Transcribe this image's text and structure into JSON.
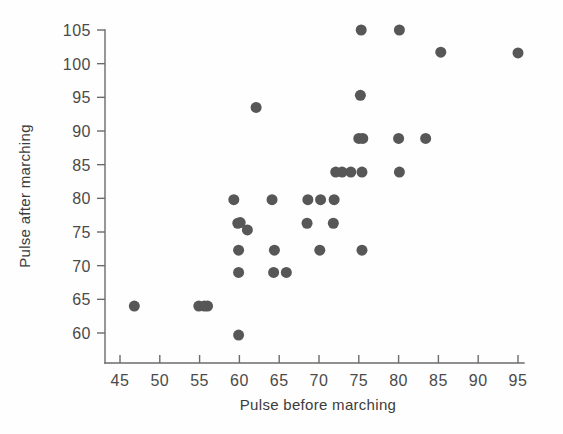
{
  "figure": {
    "name": "pulse-scatterplot",
    "background_color": "#fefefe",
    "point_color": "#575757",
    "axis_color": "#6b6b6b",
    "text_color": "#4a4a4a"
  },
  "chart_data": {
    "type": "scatter",
    "title": "",
    "xlabel": "Pulse before marching",
    "ylabel": "Pulse after marching",
    "xlim": [
      43,
      97
    ],
    "ylim": [
      57.5,
      106.5
    ],
    "xticks": [
      45,
      50,
      55,
      60,
      65,
      70,
      75,
      80,
      85,
      90,
      95
    ],
    "xticklabels": [
      "45",
      "50",
      "55",
      "60",
      "65",
      "70",
      "75",
      "80",
      "85",
      "90",
      "95"
    ],
    "yticks": [
      60,
      65,
      70,
      75,
      80,
      85,
      90,
      95,
      100,
      105
    ],
    "yticklabels": [
      "60",
      "65",
      "70",
      "75",
      "80",
      "85",
      "90",
      "95",
      "100",
      "105"
    ],
    "grid": false,
    "legend": false,
    "marker": "circle",
    "marker_size": 8,
    "n_points": 37,
    "points": [
      {
        "x": 46.8,
        "y": 64.0
      },
      {
        "x": 54.9,
        "y": 64.0
      },
      {
        "x": 56.0,
        "y": 64.0
      },
      {
        "x": 59.9,
        "y": 59.7
      },
      {
        "x": 59.9,
        "y": 69.0
      },
      {
        "x": 59.9,
        "y": 72.3
      },
      {
        "x": 59.8,
        "y": 76.3
      },
      {
        "x": 59.3,
        "y": 79.8
      },
      {
        "x": 61.0,
        "y": 75.3
      },
      {
        "x": 62.1,
        "y": 93.5
      },
      {
        "x": 64.3,
        "y": 69.0
      },
      {
        "x": 64.4,
        "y": 72.3
      },
      {
        "x": 64.1,
        "y": 79.8
      },
      {
        "x": 65.9,
        "y": 69.0
      },
      {
        "x": 68.5,
        "y": 76.3
      },
      {
        "x": 68.6,
        "y": 79.8
      },
      {
        "x": 70.1,
        "y": 72.3
      },
      {
        "x": 70.2,
        "y": 79.8
      },
      {
        "x": 71.8,
        "y": 76.3
      },
      {
        "x": 71.9,
        "y": 79.8
      },
      {
        "x": 72.1,
        "y": 83.9
      },
      {
        "x": 74.0,
        "y": 83.9
      },
      {
        "x": 75.0,
        "y": 88.9
      },
      {
        "x": 75.4,
        "y": 83.9
      },
      {
        "x": 75.4,
        "y": 72.3
      },
      {
        "x": 75.5,
        "y": 88.9
      },
      {
        "x": 75.2,
        "y": 95.3
      },
      {
        "x": 75.3,
        "y": 105.0
      },
      {
        "x": 80.1,
        "y": 83.9
      },
      {
        "x": 80.0,
        "y": 88.9
      },
      {
        "x": 80.1,
        "y": 105.0
      },
      {
        "x": 83.4,
        "y": 88.9
      },
      {
        "x": 85.3,
        "y": 101.7
      },
      {
        "x": 95.0,
        "y": 101.6
      },
      {
        "x": 72.9,
        "y": 83.9
      },
      {
        "x": 60.1,
        "y": 76.4
      },
      {
        "x": 55.6,
        "y": 64.0
      }
    ]
  }
}
